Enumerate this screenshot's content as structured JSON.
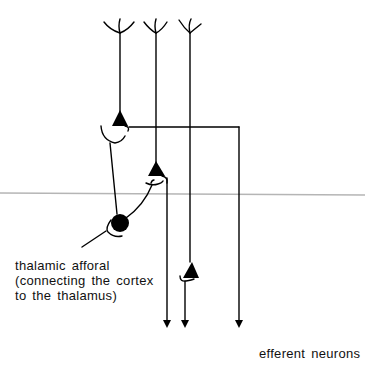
{
  "diagram": {
    "type": "neuron-circuit",
    "labels": {
      "afferent_line1": "thalamic afforal",
      "afferent_line2": "(connecting the cortex",
      "afferent_line3": "to the thalamus)",
      "efferent": "efferent neurons"
    },
    "elements": {
      "pyramidal_neurons": 3,
      "dendrite_trees": 3,
      "efferent_arrows": 3,
      "thalamic_cell": "filled-circle",
      "boundary_line_color": "#b5b5b5"
    },
    "colors": {
      "stroke": "#000000",
      "boundary": "#b5b5b5",
      "background": "#ffffff"
    }
  }
}
